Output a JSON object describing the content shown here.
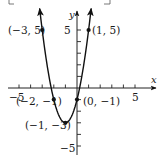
{
  "chart_data": {
    "type": "line",
    "title": "",
    "function": "y = 2x^2 + 4x - 1",
    "xlabel": "x",
    "ylabel": "y",
    "xlim": [
      -5.9,
      6.8
    ],
    "ylim": [
      -5.8,
      6.6
    ],
    "grid": false,
    "legend": null,
    "x_ticks": [
      -5,
      -4,
      -3,
      -2,
      -1,
      1,
      2,
      3,
      4,
      5
    ],
    "y_ticks": [
      -5,
      -4,
      -3,
      -2,
      -1,
      1,
      2,
      3,
      4,
      5
    ],
    "x_tick_labels": [
      {
        "value": -5,
        "text": "−5"
      },
      {
        "value": 5,
        "text": "5"
      }
    ],
    "y_tick_labels": [
      {
        "value": 5,
        "text": "5"
      },
      {
        "value": -5,
        "text": "−5"
      }
    ],
    "series": [
      {
        "name": "parabola",
        "x": [
          -3.22,
          -3,
          -2.5,
          -2,
          -1.5,
          -1,
          -0.5,
          0,
          0.5,
          1,
          1.22
        ],
        "y": [
          6.94,
          5,
          1.5,
          -1,
          -2.5,
          -3,
          -2.5,
          -1,
          1.5,
          5,
          6.94
        ]
      }
    ],
    "points": [
      {
        "x": -3,
        "y": 5,
        "label": "(−3, 5)"
      },
      {
        "x": 1,
        "y": 5,
        "label": "(1, 5)"
      },
      {
        "x": -2,
        "y": -1,
        "label": "(−2, −1)"
      },
      {
        "x": 0,
        "y": -1,
        "label": "(0, −1)"
      },
      {
        "x": -1,
        "y": -3,
        "label": "(−1, −3)"
      }
    ]
  },
  "render": {
    "origin_px": [
      77,
      88
    ],
    "unit_px": 11.6,
    "curve_color": "#111111",
    "axis_color": "#222222"
  },
  "labels": {
    "x_axis": "x",
    "y_axis": "y",
    "x_min_tick": "−5",
    "x_max_tick": "5",
    "y_max_tick": "5",
    "y_min_tick": "−5",
    "pt_m3_5": "(−3, 5)",
    "pt_1_5": "(1, 5)",
    "pt_m2_m1": "(−2, −1)",
    "pt_0_m1": "(0, −1)",
    "pt_m1_m3": "(−1, −3)"
  }
}
